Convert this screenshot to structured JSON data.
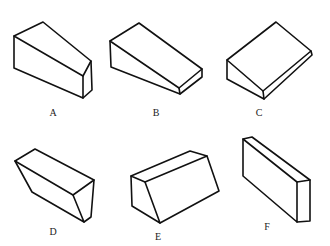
{
  "figure": {
    "background": "#ffffff",
    "stroke_color": "#111111",
    "items": [
      {
        "label": "A",
        "shape": "tapered wedge block, tall end left",
        "paths": [
          "M14,36 L43,22 L91,61 L83,76 Z",
          "M14,36 L14,68 L83,98 L83,76",
          "M91,61 L92,90 L83,98"
        ],
        "label_pos": [
          53,
          112
        ]
      },
      {
        "label": "B",
        "shape": "wedge ramp descending right",
        "paths": [
          "M110,41 L139,23 L202,69 L179,88 Z",
          "M110,41 L111,67 L180,94 L179,88",
          "M202,69 L202,77 L180,94"
        ],
        "label_pos": [
          156,
          112
        ]
      },
      {
        "label": "C",
        "shape": "wide wedge, thin front edge",
        "paths": [
          "M227,60 L276,22 L311,51 L263,91 Z",
          "M227,60 L227,79 L264,99 L263,91",
          "M311,51 L312,55 L264,99"
        ],
        "label_pos": [
          259,
          112
        ]
      },
      {
        "label": "D",
        "shape": "inverted trapezoidal prism",
        "paths": [
          "M15,161 L35,149 L94,180 L73,195 Z",
          "M15,161 L32,192 L84,222 L73,195",
          "M94,180 L91,217 L84,222"
        ],
        "label_pos": [
          53,
          231
        ]
      },
      {
        "label": "E",
        "shape": "triangular-sided prism lying down",
        "paths": [
          "M131,176 L190,151 L207,156 L145,182 Z",
          "M131,176 L132,206 L160,223 L145,182",
          "M207,156 L219,191 L160,223"
        ],
        "label_pos": [
          158,
          236
        ]
      },
      {
        "label": "F",
        "shape": "thin rectangular slab standing on edge",
        "paths": [
          "M243,139 L252,137 L310,180 L297,182 Z",
          "M243,139 L243,176 L297,222 L297,182",
          "M310,180 L310,221 L297,222"
        ],
        "label_pos": [
          267,
          226
        ]
      }
    ]
  }
}
